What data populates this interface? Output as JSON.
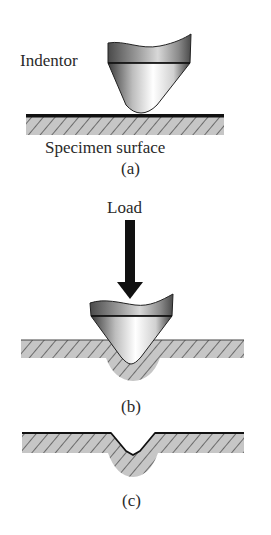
{
  "figure": {
    "panels": [
      {
        "id": "a",
        "caption": "(a)",
        "description": "Indentor above specimen surface"
      },
      {
        "id": "b",
        "caption": "(b)",
        "description": "Indentor pressed into specimen under load"
      },
      {
        "id": "c",
        "caption": "(c)",
        "description": "Residual indentation after indentor removed"
      }
    ],
    "labels": {
      "indentor": "Indentor",
      "specimen_surface": "Specimen surface",
      "load": "Load"
    }
  },
  "colors": {
    "line": "#111111",
    "hatch_fill": "#c4c4c4",
    "hatch_line": "#333333",
    "indentor_dark": "#555555",
    "indentor_light": "#f2f2f2",
    "text": "#2a2a2a"
  }
}
